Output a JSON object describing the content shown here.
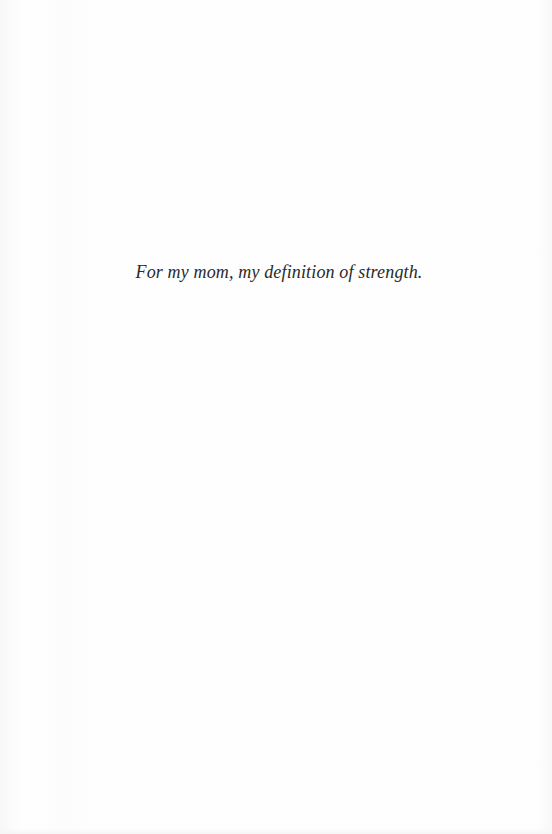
{
  "page": {
    "type": "dedication",
    "dedication_text": "For my mom, my definition of strength.",
    "colors": {
      "background": "#fefefe",
      "text": "#2a2a2a"
    }
  }
}
